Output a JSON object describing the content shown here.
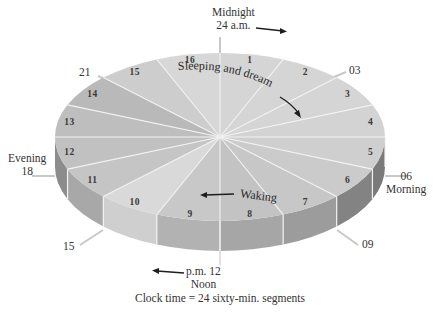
{
  "diagram": {
    "caption": "Clock time = 24 sixty-min. segments",
    "segments": [
      {
        "n": "1",
        "color": "#d5d5d5",
        "rim": "#9a9a9a"
      },
      {
        "n": "2",
        "color": "#d5d5d5",
        "rim": "#9a9a9a"
      },
      {
        "n": "3",
        "color": "#d5d5d5",
        "rim": "#9a9a9a"
      },
      {
        "n": "4",
        "color": "#d3d3d3",
        "rim": "#8e8e8e"
      },
      {
        "n": "5",
        "color": "#cfcfcf",
        "rim": "#7a7a7a"
      },
      {
        "n": "6",
        "color": "#cbcbcb",
        "rim": "#838383"
      },
      {
        "n": "7",
        "color": "#c7c7c7",
        "rim": "#9c9c9c"
      },
      {
        "n": "8",
        "color": "#c3c3c3",
        "rim": "#a6a6a6"
      },
      {
        "n": "9",
        "color": "#c8c8c8",
        "rim": "#b2b2b2"
      },
      {
        "n": "10",
        "color": "#d9d9d9",
        "rim": "#cfcfcf"
      },
      {
        "n": "11",
        "color": "#c5c5c5",
        "rim": "#a8a8a8"
      },
      {
        "n": "12",
        "color": "#c1c1c1",
        "rim": "#8c8c8c"
      },
      {
        "n": "13",
        "color": "#bebebe",
        "rim": "#8c8c8c"
      },
      {
        "n": "14",
        "color": "#b9b9b9",
        "rim": "#8c8c8c"
      },
      {
        "n": "15",
        "color": "#cdcdcd",
        "rim": "#8c8c8c"
      },
      {
        "n": "16",
        "color": "#d7d7d7",
        "rim": "#8c8c8c"
      }
    ],
    "clock_labels": {
      "midnight": {
        "title": "Midnight",
        "time": "24 a.m."
      },
      "h03": "03",
      "h06": {
        "time": "06",
        "title": "Morning"
      },
      "h09": "09",
      "noon": {
        "time": "p.m. 12",
        "title": "Noon"
      },
      "h15": "15",
      "h18": {
        "title": "Evening",
        "time": "18"
      },
      "h21": "21"
    },
    "phases": {
      "sleep": "Sleeping and dreaming",
      "wake": "Waking"
    },
    "colors": {
      "background": "#ffffff",
      "divider": "#f2f2f2",
      "tick": "#c8c8c8",
      "arrow": "#1e1e1e"
    }
  }
}
